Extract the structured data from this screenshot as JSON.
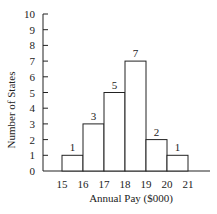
{
  "chart_data": {
    "type": "bar",
    "title": "",
    "xlabel": "Annual Pay ($000)",
    "ylabel": "Number of States",
    "bin_edges": [
      15,
      16,
      17,
      18,
      19,
      20,
      21
    ],
    "categories": [
      "15-16",
      "16-17",
      "17-18",
      "18-19",
      "19-20",
      "20-21"
    ],
    "values": [
      1,
      3,
      5,
      7,
      2,
      1
    ],
    "data_labels": [
      "1",
      "3",
      "5",
      "7",
      "2",
      "1"
    ],
    "x_tick_labels": [
      "15",
      "16",
      "17",
      "18",
      "19",
      "20",
      "21"
    ],
    "y_tick_labels": [
      "0",
      "1",
      "2",
      "3",
      "4",
      "5",
      "6",
      "7",
      "8",
      "9",
      "10"
    ],
    "ylim": [
      0,
      10
    ],
    "grid": false,
    "legend": null
  },
  "colors": {
    "ink": "#222222",
    "bar_fill": "#ffffff",
    "background": "#ffffff"
  }
}
